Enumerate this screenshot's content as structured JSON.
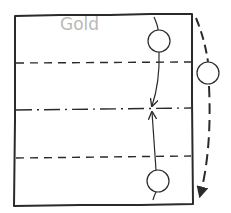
{
  "diagram": {
    "type": "origami-fold-instruction",
    "paper_color_label": "Gold",
    "colors": {
      "stroke": "#2a2a2a",
      "label": "#b9b9b9",
      "background": "#ffffff"
    },
    "paper": {
      "shape": "rectangle",
      "corners": [
        [
          15,
          15
        ],
        [
          192,
          14
        ],
        [
          193,
          204
        ],
        [
          14,
          206
        ]
      ]
    },
    "fold_lines": [
      {
        "id": "top-valley",
        "style": "dashed",
        "kind": "valley-fold",
        "y": 63
      },
      {
        "id": "center-mountain",
        "style": "dash-dot",
        "kind": "mountain-fold",
        "y": 109
      },
      {
        "id": "bottom-valley",
        "style": "dashed",
        "kind": "valley-fold",
        "y": 157
      }
    ],
    "arrows": [
      {
        "id": "top-to-center",
        "from": [
          155,
          18
        ],
        "to": [
          152,
          108
        ],
        "description": "fold top edge down to center",
        "marker_circle": [
          160,
          41
        ]
      },
      {
        "id": "bottom-to-center",
        "from": [
          152,
          200
        ],
        "to": [
          152,
          111
        ],
        "description": "fold bottom edge up to center",
        "marker_circle": [
          158,
          181
        ]
      },
      {
        "id": "turn-over",
        "style": "dashed-curve",
        "from": [
          196,
          18
        ],
        "to": [
          200,
          198
        ],
        "description": "turn over",
        "marker_circle": [
          209,
          73
        ]
      }
    ]
  }
}
